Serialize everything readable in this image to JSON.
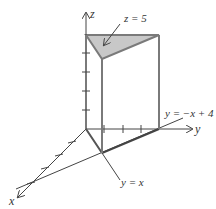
{
  "diagram": {
    "axes": {
      "x": "x",
      "y": "y",
      "z": "z"
    },
    "labels": {
      "top_plane": "z = 5",
      "line_1": "y = −x + 4",
      "line_2": "y = x"
    },
    "colors": {
      "stroke": "#555555",
      "prism_edge": "#7a7a7a",
      "top_fill": "#c8c8c8",
      "axis": "#444444"
    },
    "vertices": {
      "origin": [
        0,
        0,
        0
      ],
      "base_a": [
        2,
        2,
        0
      ],
      "base_b": [
        0,
        4,
        0
      ],
      "top_origin": [
        0,
        0,
        5
      ],
      "top_a": [
        2,
        2,
        5
      ],
      "top_b": [
        0,
        4,
        5
      ]
    }
  }
}
